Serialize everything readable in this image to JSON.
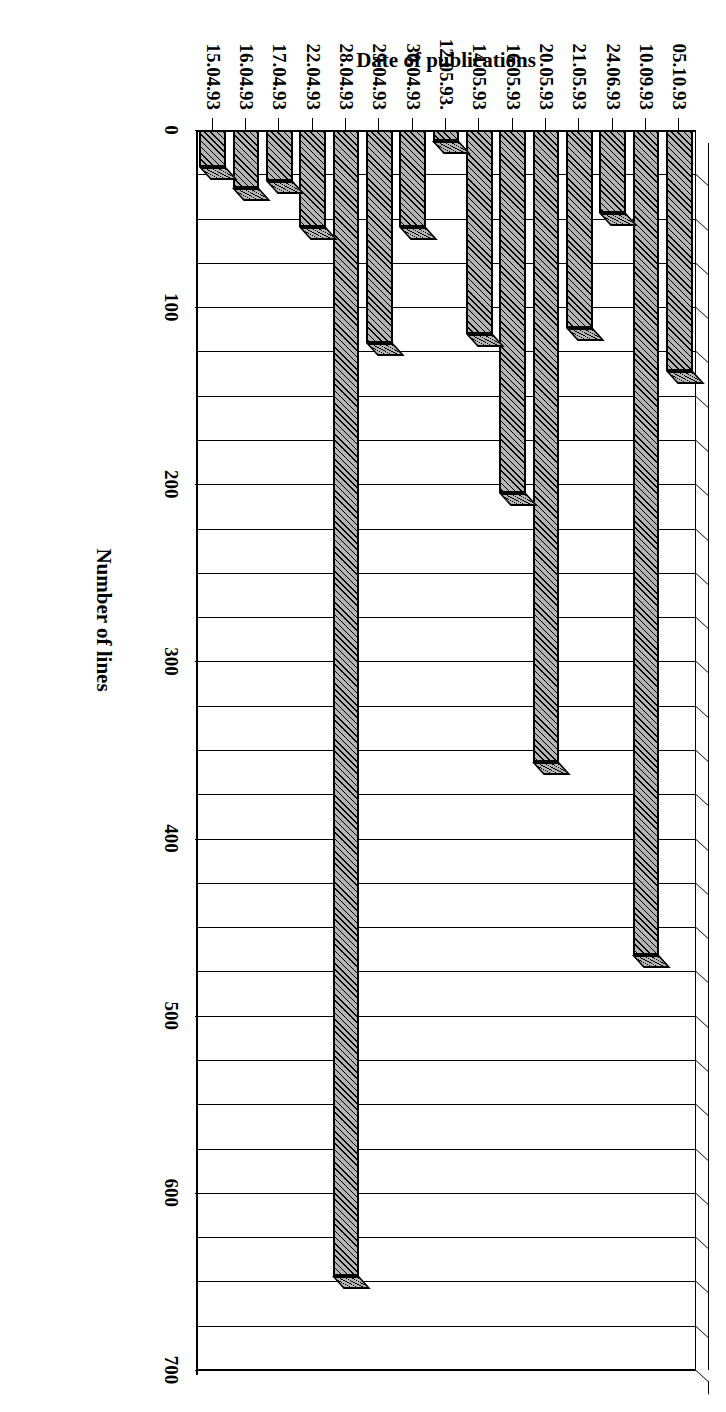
{
  "figure": {
    "orientation": "rotated-90-clockwise",
    "background_color": "#ffffff",
    "ink_color": "#000000",
    "bar_fill_color": "#b4b4b4"
  },
  "chart_data": {
    "type": "bar",
    "title": "",
    "subtitle": "",
    "xlabel": "Date of publications",
    "ylabel": "Number of lines",
    "ylim": [
      0,
      700
    ],
    "ytick_labels": [
      "0",
      "100",
      "200",
      "300",
      "400",
      "500",
      "600",
      "700"
    ],
    "ytick_values": [
      0,
      100,
      200,
      300,
      400,
      500,
      600,
      700
    ],
    "grid": true,
    "gridline_interval": 25,
    "legend": "none",
    "style": "3d-column-hatched",
    "categories": [
      "05.10.93",
      "10.09.93",
      "24.06.93",
      "21.05.93",
      "20.05.93",
      "16.05.93",
      "14.05.93",
      "12.05.93.",
      "30.04.93",
      "29.04.93",
      "28.04.93",
      "22.04.93",
      "17.04.93",
      "16.04.93",
      "15.04.93"
    ],
    "values": [
      136,
      466,
      47,
      112,
      357,
      205,
      115,
      6,
      55,
      120,
      647,
      55,
      29,
      33,
      21
    ]
  },
  "axes": {
    "value_axis_title": "Number of lines",
    "category_axis_title": "Date of publications"
  }
}
